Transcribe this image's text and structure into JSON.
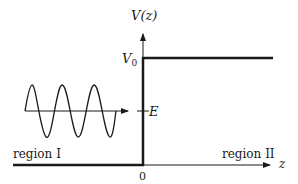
{
  "diagram": {
    "type": "potential-step",
    "axis_labels": {
      "y": "V(z)",
      "x": "z"
    },
    "levels": {
      "step_height": "V",
      "step_height_sub": "0",
      "energy": "E",
      "origin": "0"
    },
    "regions": {
      "left": "region I",
      "right": "region II"
    },
    "wave": {
      "description": "incident sinusoidal wave traveling toward the step",
      "cycles": 3
    },
    "colors": {
      "ink": "#1a1a1a",
      "background": "#ffffff"
    }
  }
}
